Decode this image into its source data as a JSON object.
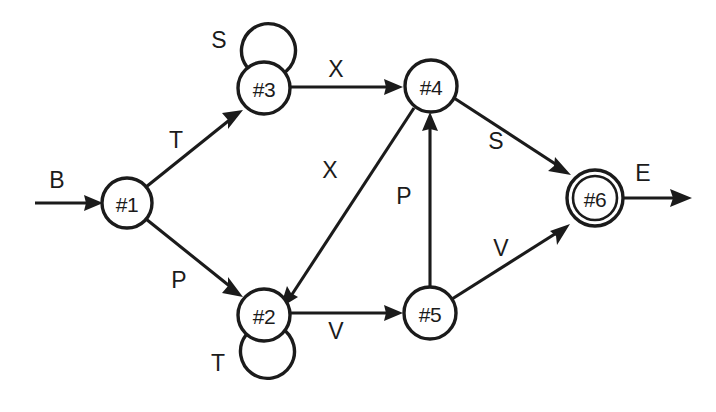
{
  "diagram": {
    "type": "finite-state-machine",
    "title_visible": false,
    "colors": {
      "stroke": "#1b1b1b",
      "node_fill": "#ffffff",
      "background": "#ffffff"
    },
    "nodes": [
      {
        "id": "1",
        "label": "#1",
        "cx": 127,
        "cy": 203,
        "r": 25,
        "accepting": false,
        "initial": true
      },
      {
        "id": "2",
        "label": "#2",
        "cx": 264,
        "cy": 315,
        "r": 26,
        "accepting": false,
        "initial": false
      },
      {
        "id": "3",
        "label": "#3",
        "cx": 264,
        "cy": 88,
        "r": 26,
        "accepting": false,
        "initial": false
      },
      {
        "id": "4",
        "label": "#4",
        "cx": 431,
        "cy": 86,
        "r": 26,
        "accepting": false,
        "initial": false
      },
      {
        "id": "5",
        "label": "#5",
        "cx": 430,
        "cy": 313,
        "r": 26,
        "accepting": false,
        "initial": false
      },
      {
        "id": "6",
        "label": "#6",
        "cx": 595,
        "cy": 198,
        "r": 28,
        "accepting": true,
        "initial": false
      }
    ],
    "entry": {
      "label": "B",
      "label_x": 57,
      "label_y": 180,
      "from_x": 35,
      "to_node": "1"
    },
    "exit": {
      "label": "E",
      "label_x": 643,
      "label_y": 173,
      "from_node": "6",
      "to_x": 692
    },
    "edges": [
      {
        "id": "e1",
        "from": "1",
        "to": "3",
        "label": "T",
        "label_x": 176,
        "label_y": 140
      },
      {
        "id": "e2",
        "from": "1",
        "to": "2",
        "label": "P",
        "label_x": 179,
        "label_y": 280
      },
      {
        "id": "e3",
        "from": "3",
        "to": "4",
        "label": "X",
        "label_x": 336,
        "label_y": 69
      },
      {
        "id": "e4",
        "from": "4",
        "to": "2",
        "label": "X",
        "label_x": 330,
        "label_y": 170
      },
      {
        "id": "e5",
        "from": "2",
        "to": "5",
        "label": "V",
        "label_x": 336,
        "label_y": 331
      },
      {
        "id": "e6",
        "from": "5",
        "to": "4",
        "label": "P",
        "label_x": 404,
        "label_y": 196
      },
      {
        "id": "e7",
        "from": "4",
        "to": "6",
        "label": "S",
        "label_x": 496,
        "label_y": 141
      },
      {
        "id": "e8",
        "from": "5",
        "to": "6",
        "label": "V",
        "label_x": 501,
        "label_y": 248
      }
    ],
    "self_loops": [
      {
        "id": "l1",
        "node": "3",
        "label": "S",
        "label_x": 219,
        "label_y": 40,
        "position": "above"
      },
      {
        "id": "l2",
        "node": "2",
        "label": "T",
        "label_x": 218,
        "label_y": 363,
        "position": "below"
      }
    ],
    "alphabet": [
      "B",
      "T",
      "P",
      "S",
      "X",
      "V",
      "E"
    ],
    "transition_table": {
      "columns": [
        "state",
        "input",
        "next_state"
      ],
      "rows": [
        [
          "#1",
          "T",
          "#3"
        ],
        [
          "#1",
          "P",
          "#2"
        ],
        [
          "#3",
          "S",
          "#3"
        ],
        [
          "#3",
          "X",
          "#4"
        ],
        [
          "#4",
          "X",
          "#2"
        ],
        [
          "#4",
          "S",
          "#6"
        ],
        [
          "#2",
          "T",
          "#2"
        ],
        [
          "#2",
          "V",
          "#5"
        ],
        [
          "#5",
          "P",
          "#4"
        ],
        [
          "#5",
          "V",
          "#6"
        ]
      ]
    }
  }
}
